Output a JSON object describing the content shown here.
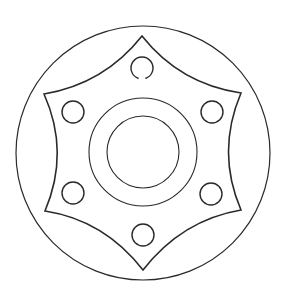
{
  "figure": {
    "type": "line-drawing",
    "background": "#ffffff",
    "stroke_color": "#2a2a2a",
    "outer_circle": {
      "cx": 143,
      "cy": 153,
      "r": 127,
      "stroke_width": 1.2
    },
    "star": {
      "stroke_width": 1.6,
      "points": [
        {
          "x": 142,
          "y": 36
        },
        {
          "x": 241,
          "y": 93
        },
        {
          "x": 241,
          "y": 210
        },
        {
          "x": 143,
          "y": 270
        },
        {
          "x": 45,
          "y": 211
        },
        {
          "x": 44,
          "y": 94
        }
      ],
      "curve_controls": [
        {
          "x": 180,
          "y": 84
        },
        {
          "x": 216,
          "y": 152
        },
        {
          "x": 182,
          "y": 220
        },
        {
          "x": 104,
          "y": 220
        },
        {
          "x": 70,
          "y": 152
        },
        {
          "x": 104,
          "y": 84
        }
      ]
    },
    "holes": [
      {
        "name": "top",
        "cx": 142,
        "cy": 68,
        "r": 11,
        "gap_bottom": true
      },
      {
        "name": "upper-right",
        "cx": 212,
        "cy": 112,
        "r": 11
      },
      {
        "name": "lower-right",
        "cx": 211,
        "cy": 194,
        "r": 11
      },
      {
        "name": "bottom",
        "cx": 143,
        "cy": 235,
        "r": 11
      },
      {
        "name": "lower-left",
        "cx": 73,
        "cy": 193,
        "r": 11
      },
      {
        "name": "upper-left",
        "cx": 73,
        "cy": 112,
        "r": 11
      }
    ],
    "center_rings": [
      {
        "name": "outer-ring",
        "cx": 143,
        "cy": 152,
        "r": 54
      },
      {
        "name": "inner-ring",
        "cx": 143,
        "cy": 152,
        "r": 36
      }
    ]
  }
}
